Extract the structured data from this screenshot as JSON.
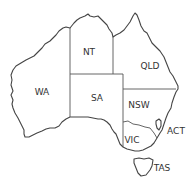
{
  "map": {
    "title": "Australia states and territories",
    "colors": {
      "outline": "#444444",
      "border": "#555555",
      "text": "#333333",
      "fill": "#ffffff"
    },
    "regions": [
      {
        "code": "WA",
        "label": "WA",
        "x": 42,
        "y": 92
      },
      {
        "code": "NT",
        "label": "NT",
        "x": 89,
        "y": 52
      },
      {
        "code": "SA",
        "label": "SA",
        "x": 97,
        "y": 98
      },
      {
        "code": "QLD",
        "label": "QLD",
        "x": 150,
        "y": 66
      },
      {
        "code": "NSW",
        "label": "NSW",
        "x": 139,
        "y": 105
      },
      {
        "code": "VIC",
        "label": "VIC",
        "x": 132,
        "y": 140
      },
      {
        "code": "ACT",
        "label": "ACT",
        "x": 175,
        "y": 131
      },
      {
        "code": "TAS",
        "label": "TAS",
        "x": 161,
        "y": 168
      }
    ]
  }
}
